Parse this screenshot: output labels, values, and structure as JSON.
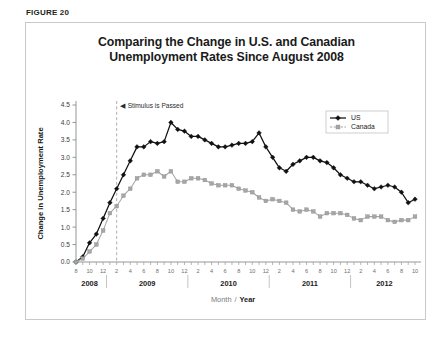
{
  "figure_label": "FIGURE 20",
  "chart_data": {
    "type": "line",
    "title": "Comparing the Change in U.S. and Canadian Unemployment Rates Since August 2008",
    "title_line1": "Comparing the Change in U.S. and Canadian",
    "title_line2": "Unemployment Rates Since August 2008",
    "xlabel_month": "Month",
    "xlabel_sep": "/",
    "xlabel_year": "Year",
    "ylabel": "Change in Unemployment Rate",
    "ylim": [
      0,
      4.5
    ],
    "yticks": [
      "0.0",
      "0.5",
      "1.0",
      "1.5",
      "2.0",
      "2.5",
      "3.0",
      "3.5",
      "4.0",
      "4.5"
    ],
    "ytick_values": [
      0,
      0.5,
      1,
      1.5,
      2,
      2.5,
      3,
      3.5,
      4,
      4.5
    ],
    "grid": false,
    "legend_position": "top-right",
    "annotations": [
      {
        "text": "Stimulus is Passed",
        "marker": "◀",
        "x_index": 6,
        "note": "dashed vertical line at February 2009"
      }
    ],
    "x": [
      "2008-08",
      "2008-09",
      "2008-10",
      "2008-11",
      "2008-12",
      "2009-01",
      "2009-02",
      "2009-03",
      "2009-04",
      "2009-05",
      "2009-06",
      "2009-07",
      "2009-08",
      "2009-09",
      "2009-10",
      "2009-11",
      "2009-12",
      "2010-01",
      "2010-02",
      "2010-03",
      "2010-04",
      "2010-05",
      "2010-06",
      "2010-07",
      "2010-08",
      "2010-09",
      "2010-10",
      "2010-11",
      "2010-12",
      "2011-01",
      "2011-02",
      "2011-03",
      "2011-04",
      "2011-05",
      "2011-06",
      "2011-07",
      "2011-08",
      "2011-09",
      "2011-10",
      "2011-11",
      "2011-12",
      "2012-01",
      "2012-02",
      "2012-03",
      "2012-04",
      "2012-05",
      "2012-06",
      "2012-07",
      "2012-08",
      "2012-09",
      "2012-10"
    ],
    "xtick_labels": [
      "8",
      "10",
      "12",
      "2",
      "4",
      "6",
      "8",
      "10",
      "12",
      "2",
      "4",
      "6",
      "8",
      "10",
      "12",
      "2",
      "4",
      "6",
      "8",
      "10",
      "12",
      "2",
      "4",
      "6",
      "8",
      "10"
    ],
    "year_groups": [
      {
        "label": "2008",
        "start": "2008-08",
        "end": "2008-12"
      },
      {
        "label": "2009",
        "start": "2009-01",
        "end": "2009-12"
      },
      {
        "label": "2010",
        "start": "2010-01",
        "end": "2010-12"
      },
      {
        "label": "2011",
        "start": "2011-01",
        "end": "2011-12"
      },
      {
        "label": "2012",
        "start": "2012-01",
        "end": "2012-10"
      }
    ],
    "series": [
      {
        "name": "US",
        "color": "#111111",
        "marker": "diamond",
        "values": [
          0.0,
          0.15,
          0.55,
          0.8,
          1.25,
          1.7,
          2.1,
          2.5,
          2.9,
          3.3,
          3.3,
          3.45,
          3.4,
          3.45,
          4.0,
          3.8,
          3.75,
          3.6,
          3.6,
          3.5,
          3.4,
          3.3,
          3.3,
          3.35,
          3.4,
          3.4,
          3.45,
          3.7,
          3.3,
          3.0,
          2.7,
          2.6,
          2.8,
          2.9,
          3.0,
          3.0,
          2.9,
          2.85,
          2.7,
          2.5,
          2.4,
          2.3,
          2.3,
          2.2,
          2.1,
          2.15,
          2.2,
          2.15,
          2.0,
          1.7,
          1.8
        ]
      },
      {
        "name": "Canada",
        "color": "#a6a6a6",
        "marker": "square",
        "values": [
          0.0,
          0.1,
          0.3,
          0.5,
          0.9,
          1.4,
          1.6,
          1.9,
          2.1,
          2.4,
          2.5,
          2.5,
          2.6,
          2.45,
          2.6,
          2.3,
          2.3,
          2.4,
          2.4,
          2.35,
          2.25,
          2.2,
          2.2,
          2.2,
          2.1,
          2.05,
          2.0,
          1.85,
          1.75,
          1.8,
          1.75,
          1.7,
          1.5,
          1.45,
          1.5,
          1.45,
          1.3,
          1.4,
          1.4,
          1.4,
          1.35,
          1.25,
          1.2,
          1.3,
          1.3,
          1.3,
          1.2,
          1.15,
          1.2,
          1.2,
          1.3
        ]
      }
    ]
  }
}
